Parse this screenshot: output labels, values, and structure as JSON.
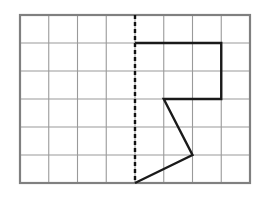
{
  "figure": {
    "type": "geometry-grid",
    "background_color": "#ffffff"
  },
  "grid": {
    "columns": 8,
    "rows": 6,
    "cell_width": 28.75,
    "cell_height": 28,
    "origin_x": 20,
    "origin_y": 15,
    "inner_line_color": "#9a9a9a",
    "inner_line_width": 1.1,
    "border_color": "#808080",
    "border_width": 2.2,
    "border_x": 20,
    "border_y": 15,
    "border_width_px": 230,
    "border_height_px": 168
  },
  "line_of_symmetry": {
    "name": "dashed-vertical-axis",
    "orientation": "vertical",
    "grid_column": 4,
    "x": 135,
    "y_start": 15,
    "y_end": 183,
    "color": "#111111",
    "stroke_width": 2.4,
    "dash_pattern": "4,3"
  },
  "shape": {
    "name": "open-polyline-figure",
    "color": "#1a1a1a",
    "stroke_width": 2.4,
    "closed": false,
    "grid_vertices": [
      {
        "col": 4,
        "row": 1
      },
      {
        "col": 7,
        "row": 1
      },
      {
        "col": 7,
        "row": 3
      },
      {
        "col": 5,
        "row": 3
      },
      {
        "col": 6,
        "row": 5
      },
      {
        "col": 4,
        "row": 6
      }
    ],
    "points_px": "135,43 221.25,43 221.25,99 163.75,99 192.5,155 135,183",
    "segments": [
      {
        "name": "top-horizontal",
        "from": "(4,1)",
        "to": "(7,1)"
      },
      {
        "name": "right-vertical",
        "from": "(7,1)",
        "to": "(7,3)"
      },
      {
        "name": "middle-horizontal",
        "from": "(7,3)",
        "to": "(5,3)"
      },
      {
        "name": "upper-diagonal",
        "from": "(5,3)",
        "to": "(6,5)"
      },
      {
        "name": "lower-diagonal",
        "from": "(6,5)",
        "to": "(4,6)"
      }
    ]
  }
}
